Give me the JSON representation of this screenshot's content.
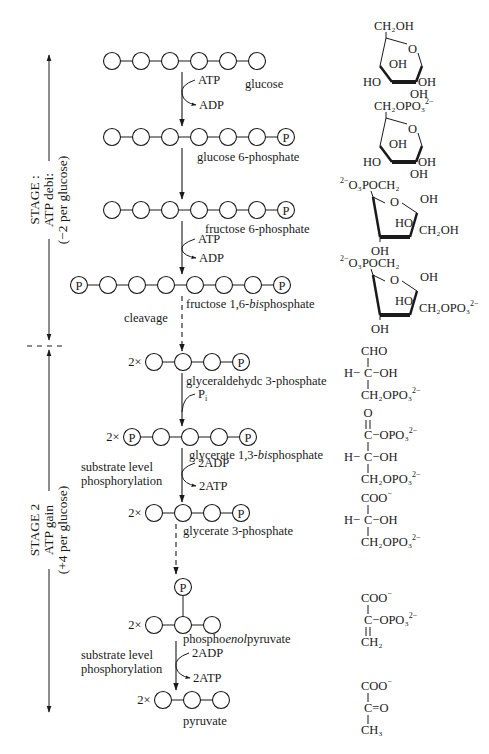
{
  "diagram": {
    "stages": [
      {
        "id": "stage1",
        "lines": [
          "STAGE 1",
          "ATP debit",
          "(−2 per glucose)"
        ],
        "display_lines": [
          "STAGE :",
          "ATP debi:",
          "(−2 per glucose)"
        ],
        "y_top": 55,
        "y_bottom": 340,
        "label_center_y": 200
      },
      {
        "id": "stage2",
        "lines": [
          "STAGE 2",
          "ATP gain",
          "(+4 per glucose)"
        ],
        "y_top": 350,
        "y_bottom": 712,
        "label_center_y": 530
      }
    ],
    "divider_y": 346,
    "intermediates": [
      {
        "id": "glucose",
        "label": "glucose",
        "label_parts": [
          {
            "t": "glucose",
            "i": false
          }
        ],
        "y": 61,
        "multiplier": "",
        "chain": [
          "C",
          "C",
          "C",
          "C",
          "C",
          "C"
        ],
        "x_start": 112,
        "spacing": 29,
        "label_x": 245,
        "label_y": 88
      },
      {
        "id": "glucose-6-phosphate",
        "label": "glucose 6-phosphate",
        "label_parts": [
          {
            "t": "glucose 6-phosphate",
            "i": false
          }
        ],
        "y": 137,
        "multiplier": "",
        "chain": [
          "C",
          "C",
          "C",
          "C",
          "C",
          "C",
          "P"
        ],
        "x_start": 112,
        "spacing": 29,
        "label_x": 197,
        "label_y": 161
      },
      {
        "id": "fructose-6-phosphate",
        "label": "fructose 6-phosphate",
        "label_parts": [
          {
            "t": "fructose 6-phosphate",
            "i": false
          }
        ],
        "y": 210,
        "multiplier": "",
        "chain": [
          "C",
          "C",
          "C",
          "C",
          "C",
          "C",
          "P"
        ],
        "x_start": 112,
        "spacing": 29,
        "label_x": 205,
        "label_y": 233
      },
      {
        "id": "fructose-1-6-bisphosphate",
        "label": "fructose 1,6-bisphosphate",
        "label_parts": [
          {
            "t": "fructose 1,6-",
            "i": false
          },
          {
            "t": "bis",
            "i": true
          },
          {
            "t": "phosphate",
            "i": false
          }
        ],
        "y": 285,
        "multiplier": "",
        "chain": [
          "P",
          "C",
          "C",
          "C",
          "C",
          "C",
          "C",
          "P"
        ],
        "x_start": 79,
        "spacing": 29,
        "label_x": 186,
        "label_y": 308
      },
      {
        "id": "glyceraldehyde-3-phosphate",
        "label": "glyceraldehydc 3-phosphate",
        "label_parts": [
          {
            "t": "glyceraldehydc 3-phosphate",
            "i": false
          }
        ],
        "y": 362,
        "multiplier": "2×",
        "chain": [
          "C",
          "C",
          "C",
          "P"
        ],
        "x_start": 154,
        "spacing": 29,
        "label_x": 186,
        "label_y": 385
      },
      {
        "id": "glycerate-1-3-bisphosphate",
        "label": "glycerate 1,3-bisphosphate",
        "label_parts": [
          {
            "t": "glycerate 1,3-",
            "i": false
          },
          {
            "t": "bis",
            "i": true
          },
          {
            "t": "phosphate",
            "i": false
          }
        ],
        "y": 437,
        "multiplier": "2×",
        "chain": [
          "P",
          "C",
          "C",
          "C",
          "P"
        ],
        "x_start": 132,
        "spacing": 29,
        "label_x": 189,
        "label_y": 459
      },
      {
        "id": "glycerate-3-phosphate",
        "label": "glycerate 3-phosphate",
        "label_parts": [
          {
            "t": "glycerate 3-phosphate",
            "i": false
          }
        ],
        "y": 513,
        "multiplier": "2×",
        "chain": [
          "C",
          "C",
          "C",
          "P"
        ],
        "x_start": 154,
        "spacing": 29,
        "label_x": 183,
        "label_y": 535
      },
      {
        "id": "phosphoenolpyruvate",
        "label": "phosphoenolpyruvate",
        "label_parts": [
          {
            "t": "phospho",
            "i": false
          },
          {
            "t": "enol",
            "i": true
          },
          {
            "t": "pyruvate",
            "i": false
          }
        ],
        "y": 625,
        "multiplier": "2×",
        "chain": [
          "C",
          "C",
          "C"
        ],
        "x_start": 154,
        "spacing": 29,
        "label_x": 183,
        "label_y": 643,
        "branch_phosphate": {
          "index": 1,
          "y": 587
        }
      },
      {
        "id": "pyruvate",
        "label": "pyruvate",
        "label_parts": [
          {
            "t": "pyruvate",
            "i": false
          }
        ],
        "y": 700,
        "multiplier": "2×",
        "chain": [
          "C",
          "C",
          "C"
        ],
        "x_start": 163,
        "spacing": 29,
        "label_x": 183,
        "label_y": 725
      }
    ],
    "arrows": [
      {
        "id": "a1",
        "x": 182,
        "y1": 72,
        "y2": 126,
        "dashed": false
      },
      {
        "id": "a2",
        "x": 182,
        "y1": 148,
        "y2": 199,
        "dashed": false
      },
      {
        "id": "a3",
        "x": 182,
        "y1": 221,
        "y2": 274,
        "dashed": false
      },
      {
        "id": "a4",
        "x": 182,
        "y1": 296,
        "y2": 351,
        "dashed": true
      },
      {
        "id": "a5",
        "x": 182,
        "y1": 373,
        "y2": 426,
        "dashed": false
      },
      {
        "id": "a6",
        "x": 182,
        "y1": 448,
        "y2": 502,
        "dashed": false
      },
      {
        "id": "a7",
        "x": 176,
        "y1": 524,
        "y2": 574,
        "dashed": true
      },
      {
        "id": "a8",
        "x": 176,
        "y1": 641,
        "y2": 690,
        "dashed": false
      }
    ],
    "side_reactions": [
      {
        "id": "hexokinase",
        "in": "ATP",
        "out": "ADP",
        "x": 182,
        "y_in": 83,
        "y_out": 105
      },
      {
        "id": "pfk",
        "in": "ATP",
        "out": "ADP",
        "x": 182,
        "y_in": 242,
        "y_out": 258
      },
      {
        "id": "gapdh",
        "in": "P",
        "in_sub": "i",
        "out": "",
        "x": 182,
        "y_in": 398,
        "y_out": 0
      },
      {
        "id": "pgk",
        "in": "2ADP",
        "out": "2ATP",
        "x": 182,
        "y_in": 466,
        "y_out": 486
      },
      {
        "id": "pk",
        "in": "2ADP",
        "out": "2ATP",
        "x": 176,
        "y_in": 656,
        "y_out": 678
      }
    ],
    "annotations": [
      {
        "id": "cleavage",
        "lines": [
          "cleavage"
        ],
        "x": 124,
        "y": 322
      },
      {
        "id": "substrate-level-1",
        "lines": [
          "substrate level",
          "phosphorylation"
        ],
        "x": 81,
        "y": 471
      },
      {
        "id": "substrate-level-2",
        "lines": [
          "substrate level",
          "phosphorylation"
        ],
        "x": 81,
        "y": 659
      }
    ],
    "structures": [
      {
        "id": "glucose-structure",
        "type": "pyranose",
        "top": "CH₂OH",
        "top_charge": "",
        "left": "HO",
        "right": "OH",
        "bottom": "OH",
        "inner": "OH",
        "ring_o": "O",
        "x": 372,
        "y": 18
      },
      {
        "id": "g6p-structure",
        "type": "pyranose",
        "top": "CH₂OPO₃",
        "top_charge": "2−",
        "left": "HO",
        "right": "OH",
        "bottom": "OH",
        "inner": "OH",
        "ring_o": "O",
        "x": 372,
        "y": 98
      },
      {
        "id": "f6p-structure",
        "type": "furanose",
        "left_top": "O₃POCH₂",
        "left_charge": "2−",
        "right_top": "OH",
        "right": "CH₂OH",
        "right_charge": "",
        "inner": "HO",
        "bottom": "OH",
        "ring_o": "O",
        "x": 355,
        "y": 175
      },
      {
        "id": "f16bp-structure",
        "type": "furanose",
        "left_top": "O₃POCH₂",
        "left_charge": "2−",
        "right_top": "OH",
        "right": "CH₂OPO₃",
        "right_charge": "2−",
        "inner": "HO",
        "bottom": "OH",
        "ring_o": "O",
        "x": 355,
        "y": 253
      },
      {
        "id": "gap-structure",
        "type": "chain",
        "x": 362,
        "y": 343,
        "rows": [
          {
            "left": "",
            "center": "CHO",
            "right": "",
            "charge": "",
            "bond_above": ""
          },
          {
            "left": "H−",
            "center": "C",
            "right": "−OH",
            "charge": "",
            "bond_above": "single"
          },
          {
            "left": "",
            "center": "CH₂OPO₃",
            "right": "",
            "charge": "2−",
            "bond_above": "single"
          }
        ]
      },
      {
        "id": "bpg-structure",
        "type": "chain",
        "x": 362,
        "y": 405,
        "rows": [
          {
            "left": "",
            "center": "O",
            "right": "",
            "charge": "",
            "bond_above": ""
          },
          {
            "left": "",
            "center": "C",
            "right": "−OPO₃",
            "charge": "2−",
            "bond_above": "double"
          },
          {
            "left": "H−",
            "center": "C",
            "right": "−OH",
            "charge": "",
            "bond_above": "single"
          },
          {
            "left": "",
            "center": "CH₂OPO₃",
            "right": "",
            "charge": "2−",
            "bond_above": "single"
          }
        ]
      },
      {
        "id": "3pg-structure",
        "type": "chain",
        "x": 362,
        "y": 490,
        "rows": [
          {
            "left": "",
            "center": "COO",
            "right": "",
            "charge": "−",
            "bond_above": ""
          },
          {
            "left": "H−",
            "center": "C",
            "right": "−OH",
            "charge": "",
            "bond_above": "single"
          },
          {
            "left": "",
            "center": "CH₂OPO₃",
            "right": "",
            "charge": "2−",
            "bond_above": "single"
          }
        ]
      },
      {
        "id": "pep-structure",
        "type": "chain",
        "x": 362,
        "y": 590,
        "rows": [
          {
            "left": "",
            "center": "COO",
            "right": "",
            "charge": "−",
            "bond_above": ""
          },
          {
            "left": "",
            "center": "C",
            "right": "−OPO₃",
            "charge": "2−",
            "bond_above": "single"
          },
          {
            "left": "",
            "center": "CH₂",
            "right": "",
            "charge": "",
            "bond_above": "double"
          }
        ]
      },
      {
        "id": "pyruvate-structure",
        "type": "chain",
        "x": 362,
        "y": 678,
        "rows": [
          {
            "left": "",
            "center": "COO",
            "right": "",
            "charge": "−",
            "bond_above": ""
          },
          {
            "left": "",
            "center": "C",
            "right": "=O",
            "charge": "",
            "bond_above": "single"
          },
          {
            "left": "",
            "center": "CH₃",
            "right": "",
            "charge": "",
            "bond_above": "single"
          }
        ]
      }
    ],
    "colors": {
      "ink": "#1a1a1a",
      "background": "#ffffff"
    }
  }
}
